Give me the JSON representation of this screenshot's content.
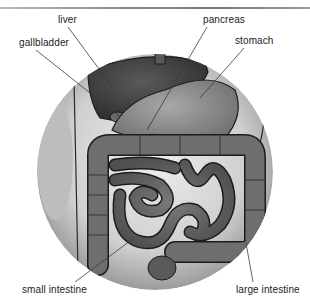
{
  "diagram": {
    "type": "anatomical-labeled-illustration",
    "labels": [
      {
        "id": "liver",
        "text": "liver",
        "x": 58,
        "y": 14,
        "line": [
          68,
          27,
          113,
          88
        ]
      },
      {
        "id": "gallbladder",
        "text": "gallbladder",
        "x": 19,
        "y": 37,
        "line": [
          36,
          50,
          119,
          116
        ]
      },
      {
        "id": "pancreas",
        "text": "pancreas",
        "x": 203,
        "y": 14,
        "line": [
          207,
          27,
          147,
          130
        ]
      },
      {
        "id": "stomach",
        "text": "stomach",
        "x": 235,
        "y": 35,
        "line": [
          244,
          48,
          200,
          98
        ]
      },
      {
        "id": "small-intestine",
        "text": "small intestine",
        "x": 22,
        "y": 284,
        "line": [
          75,
          282,
          134,
          238
        ]
      },
      {
        "id": "large-intestine",
        "text": "large intestine",
        "x": 236,
        "y": 284,
        "line": [
          253,
          282,
          246,
          243
        ]
      }
    ]
  },
  "colors": {
    "background": "#ffffff",
    "rule": "#8a8a8a",
    "label_text": "#222222",
    "leader_line": "#3a3a3a",
    "circle_bg": "#d6d6d6",
    "organ_dark": "#3c3c3c",
    "organ_mid": "#6a6a6a",
    "organ_light": "#9a9a9a",
    "pancreas": "#e4e4e4"
  }
}
